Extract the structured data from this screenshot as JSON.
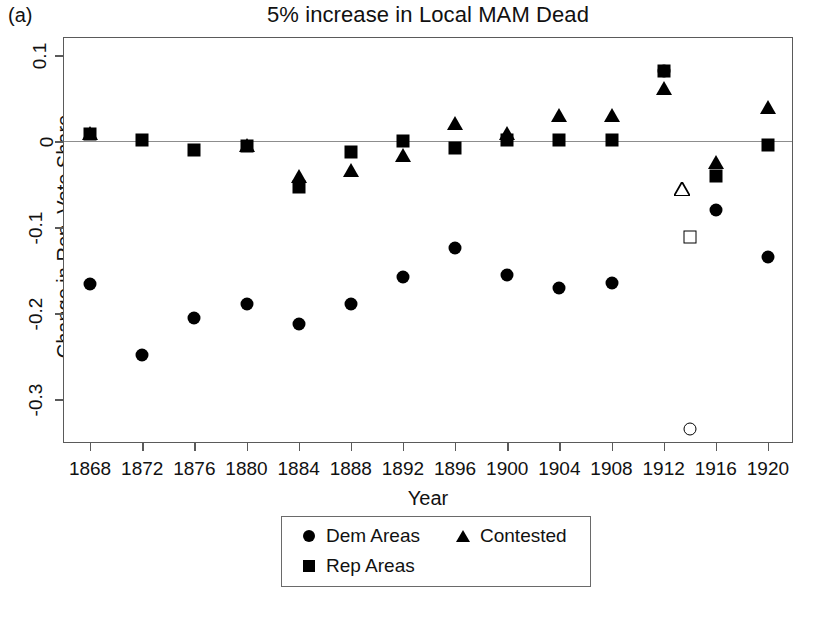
{
  "panel_label": "(a)",
  "chart_data": {
    "type": "scatter",
    "title": "5% increase in Local MAM Dead",
    "xlabel": "Year",
    "ylabel": "Change in Rep. Vote Share",
    "grid": false,
    "zero_reference_line": true,
    "legend_position": "bottom-center",
    "xlim": [
      1866,
      1922
    ],
    "ylim": [
      -0.352,
      0.12
    ],
    "xticks": [
      1868,
      1872,
      1876,
      1880,
      1884,
      1888,
      1892,
      1896,
      1900,
      1904,
      1908,
      1912,
      1916,
      1920
    ],
    "xtick_labels": [
      "1868",
      "1872",
      "1876",
      "1880",
      "1884",
      "1888",
      "1892",
      "1896",
      "1900",
      "1904",
      "1908",
      "1912",
      "1916",
      "1920"
    ],
    "yticks": [
      0.1,
      0,
      -0.1,
      -0.2,
      -0.3
    ],
    "ytick_labels": [
      "0.1",
      "0",
      "-0.1",
      "-0.2",
      "-0.3"
    ],
    "series": [
      {
        "name": "Dem Areas",
        "marker": "circle",
        "fill": "filled",
        "color": "#000000",
        "x": [
          1868,
          1872,
          1876,
          1880,
          1884,
          1888,
          1892,
          1896,
          1900,
          1904,
          1908,
          1912,
          1916,
          1920
        ],
        "values": [
          -0.166,
          -0.249,
          -0.205,
          -0.189,
          -0.212,
          -0.189,
          -0.158,
          -0.124,
          -0.155,
          -0.171,
          -0.165,
          0.082,
          -0.08,
          -0.135
        ]
      },
      {
        "name": "Rep Areas",
        "marker": "square",
        "fill": "filled",
        "color": "#000000",
        "x": [
          1868,
          1872,
          1876,
          1880,
          1884,
          1888,
          1892,
          1896,
          1900,
          1904,
          1908,
          1912,
          1916,
          1920
        ],
        "values": [
          0.008,
          0.001,
          -0.01,
          -0.006,
          -0.053,
          -0.013,
          0.0,
          -0.008,
          0.002,
          0.001,
          0.002,
          0.082,
          -0.041,
          -0.004
        ]
      },
      {
        "name": "Contested",
        "marker": "triangle",
        "fill": "filled",
        "color": "#000000",
        "x": [
          1868,
          1880,
          1884,
          1888,
          1892,
          1896,
          1900,
          1904,
          1908,
          1912,
          1916,
          1920
        ],
        "values": [
          0.01,
          -0.004,
          -0.04,
          -0.034,
          -0.016,
          0.021,
          0.01,
          0.031,
          0.03,
          0.062,
          -0.024,
          0.04
        ]
      },
      {
        "name": "Open markers",
        "marker": "mixed",
        "fill": "open",
        "color": "#000000",
        "x": [
          1914,
          1914,
          1914
        ],
        "values": [
          -0.056,
          -0.111,
          -0.335
        ],
        "markers": [
          "triangle",
          "square",
          "circle"
        ]
      }
    ]
  },
  "legend": {
    "entries": [
      {
        "label": "Dem Areas",
        "marker": "circle"
      },
      {
        "label": "Contested",
        "marker": "triangle"
      },
      {
        "label": "Rep Areas",
        "marker": "square"
      }
    ]
  }
}
